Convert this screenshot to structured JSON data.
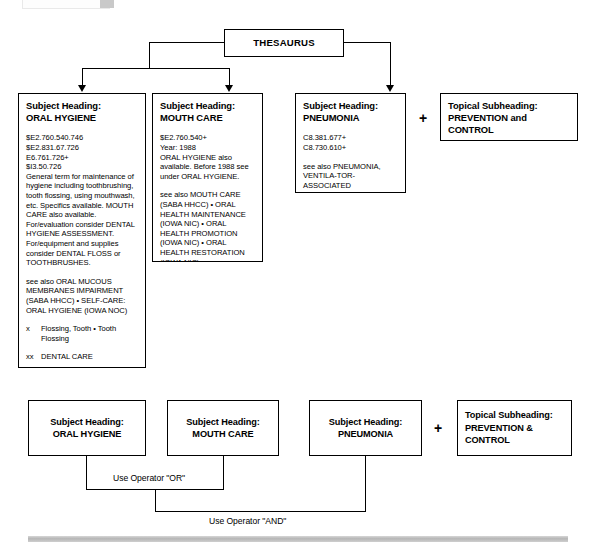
{
  "diagram": {
    "root": {
      "label": "THESAURUS"
    },
    "operators": {
      "plus_symbol": "+",
      "or_label": "Use Operator \"OR\"",
      "and_label": "Use Operator \"AND\""
    },
    "top_row": [
      {
        "kind_label": "Subject Heading:",
        "term": "ORAL HYGIENE",
        "codes": [
          "$E2.760.540.746",
          "$E2.831.67.726",
          "E6.761.726+",
          "$I3.50.726"
        ],
        "scope_note": "General term for maintenance of hygiene including toothbrushing, tooth flossing, using mouthwash, etc. Specifics available. MOUTH CARE also available. For/evaluation consider DENTAL HYGIENE ASSESSMENT. For/equipment and supplies consider DENTAL FLOSS or TOOTHBRUSHES.",
        "see_also": "see also ORAL MUCOUS MEMBRANES IMPAIRMENT (SABA HHCC) • SELF-CARE: ORAL HYGIENE (IOWA NOC)",
        "x_tag": "x",
        "x_text": "Flossing, Tooth • Tooth Flossing",
        "xx_tag": "xx",
        "xx_text": "DENTAL CARE"
      },
      {
        "kind_label": "Subject Heading:",
        "term": "MOUTH CARE",
        "codes": [
          "$E2.760.540+"
        ],
        "year": "Year: 1988",
        "scope_note": "ORAL HYGIENE also available. Before 1988 see under ORAL HYGIENE.",
        "see_also": "see also MOUTH CARE (SABA HHCC) • ORAL HEALTH MAINTENANCE (IOWA NIC) • ORAL HEALTH PROMOTION (IOWA NIC) • ORAL HEALTH RESTORATION (IOWA NIC)"
      },
      {
        "kind_label": "Subject Heading:",
        "term": "PNEUMONIA",
        "codes": [
          "C8.381.677+",
          "C8.730.610+"
        ],
        "see_also": "see also PNEUMONIA, VENTILA-TOR-ASSOCIATED"
      },
      {
        "kind_label": "Topical Subheading:",
        "term": "PREVENTION and CONTROL"
      }
    ],
    "bottom_row": [
      {
        "kind_label": "Subject Heading:",
        "term": "ORAL HYGIENE"
      },
      {
        "kind_label": "Subject Heading:",
        "term": "MOUTH CARE"
      },
      {
        "kind_label": "Subject Heading:",
        "term": "PNEUMONIA"
      },
      {
        "kind_label": "Topical Subheading:",
        "term": "PREVENTION & CONTROL"
      }
    ]
  }
}
